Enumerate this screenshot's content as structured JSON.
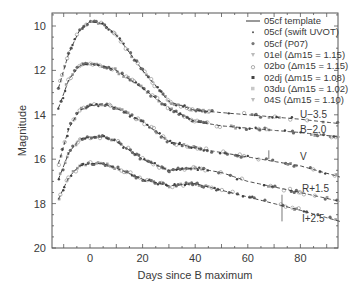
{
  "chart_data": {
    "type": "scatter",
    "title": "",
    "xlabel": "Days since B maximum",
    "ylabel": "Magnitude",
    "xlim": [
      -14,
      95
    ],
    "ylim": [
      20,
      9.5
    ],
    "y_inverted": true,
    "x_ticks": [
      0,
      20,
      40,
      60,
      80
    ],
    "y_ticks": [
      10,
      12,
      14,
      16,
      18,
      20
    ],
    "grid": false,
    "legend_position": "upper right",
    "legend": [
      {
        "label": "05cf template",
        "marker": "line"
      },
      {
        "label": "05cf (swift UVOT)",
        "marker": "small-dot"
      },
      {
        "label": "05cf (P07)",
        "marker": "dot"
      },
      {
        "label": "01el (Δm15 = 1.15)",
        "marker": "triangle"
      },
      {
        "label": "02bo (Δm15 = 1.15)",
        "marker": "open-circle"
      },
      {
        "label": "02dj (Δm15 = 1.08)",
        "marker": "filled-square"
      },
      {
        "label": "03du (Δm15 = 1.02)",
        "marker": "light-square"
      },
      {
        "label": "04S (Δm15 = 1.10)",
        "marker": "triangle"
      }
    ],
    "series": [
      {
        "name": "U-3.5",
        "x": [
          -12,
          -8,
          -4,
          0,
          5,
          10,
          15,
          20,
          30,
          40,
          60,
          80,
          95
        ],
        "values": [
          12.8,
          11.2,
          10.2,
          9.8,
          9.9,
          10.4,
          11.2,
          12.0,
          13.4,
          13.8,
          14.0,
          14.2,
          14.4
        ]
      },
      {
        "name": "B-2.0",
        "x": [
          -12,
          -8,
          -4,
          0,
          5,
          10,
          20,
          30,
          40,
          50,
          60,
          80,
          95
        ],
        "values": [
          13.7,
          12.4,
          11.8,
          11.7,
          11.8,
          12.0,
          12.8,
          13.7,
          14.3,
          14.5,
          14.6,
          14.8,
          15.0
        ]
      },
      {
        "name": "V",
        "x": [
          -12,
          -8,
          -4,
          0,
          5,
          10,
          20,
          30,
          40,
          50,
          60,
          80,
          95
        ],
        "values": [
          16.2,
          14.6,
          13.8,
          13.6,
          13.5,
          13.7,
          14.3,
          15.2,
          15.5,
          15.7,
          15.9,
          16.3,
          16.8
        ]
      },
      {
        "name": "R+1.5",
        "x": [
          -12,
          -8,
          -4,
          0,
          5,
          10,
          20,
          30,
          40,
          50,
          60,
          80,
          95
        ],
        "values": [
          16.9,
          15.7,
          15.1,
          15.0,
          15.0,
          15.2,
          16.0,
          16.5,
          16.4,
          16.6,
          17.0,
          17.5,
          17.9
        ]
      },
      {
        "name": "I+2.5",
        "x": [
          -12,
          -8,
          -4,
          0,
          5,
          10,
          20,
          30,
          40,
          50,
          60,
          80,
          95
        ],
        "values": [
          17.8,
          16.8,
          16.3,
          16.2,
          16.2,
          16.4,
          16.9,
          17.2,
          17.1,
          17.4,
          17.7,
          18.3,
          18.8
        ]
      }
    ],
    "annotations": [
      {
        "text": "U−3.5",
        "x": 80,
        "y": 14.2
      },
      {
        "text": "B−2.0",
        "x": 80,
        "y": 14.8
      },
      {
        "text": "V",
        "x": 80,
        "y": 15.9
      },
      {
        "text": "R+1.5",
        "x": 80,
        "y": 17.3
      },
      {
        "text": "I+2.5",
        "x": 80,
        "y": 18.6
      }
    ]
  }
}
